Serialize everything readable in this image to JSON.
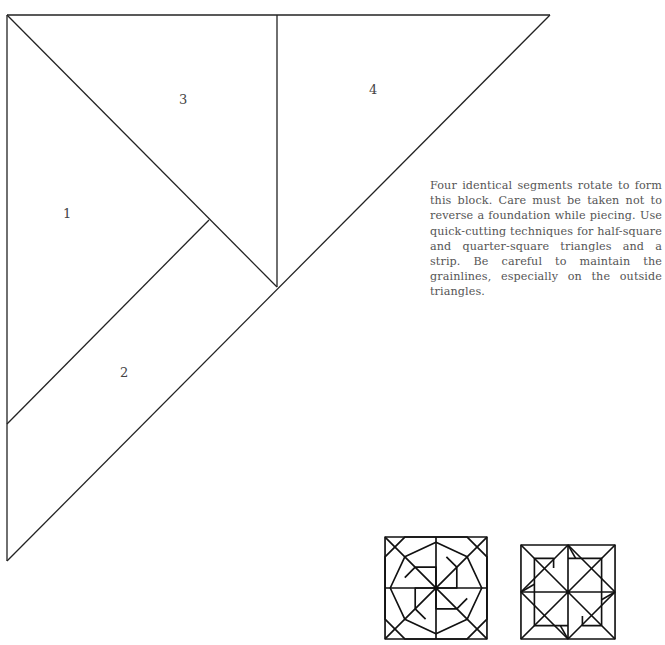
{
  "pattern": {
    "segments": [
      {
        "id": "1",
        "label": "1"
      },
      {
        "id": "2",
        "label": "2"
      },
      {
        "id": "3",
        "label": "3"
      },
      {
        "id": "4",
        "label": "4"
      }
    ],
    "line_color": "#222222"
  },
  "description": "Four identical segments rotate to form this block. Care must be taken not to reverse a foundation while piecing. Use quick-cutting techniques for half-square and quarter-square triangles and a strip. Be careful to maintain the grainlines, especially on the out­side triangles.",
  "thumbnails": [
    {
      "name": "block-diagram-a"
    },
    {
      "name": "block-diagram-b"
    }
  ]
}
